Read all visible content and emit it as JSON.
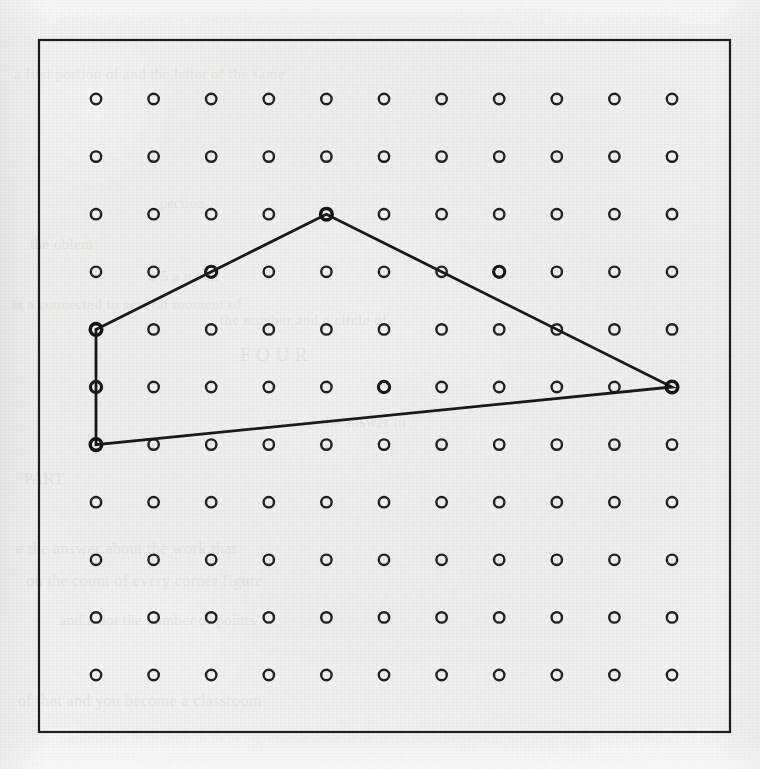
{
  "figure": {
    "kind": "geoboard-pegboard-figure",
    "background_color": "#f1f0ee",
    "ink_color": "#1a1918",
    "frame": {
      "x": 39,
      "y": 40,
      "width": 691,
      "height": 692,
      "stroke_color": "#1d1c1b",
      "stroke_width": 2.2
    }
  },
  "grid": {
    "columns": 11,
    "rows": 11,
    "origin_x": 96,
    "origin_y": 99,
    "spacing_x": 57.6,
    "spacing_y": 57.6,
    "peg_radius": 5.2,
    "peg_label": "peg",
    "peg_color": "#23211f"
  },
  "chart_data": {
    "type": "scatter",
    "title": "",
    "subtitle": "",
    "xlabel": "",
    "ylabel": "",
    "grid": true,
    "legend": "none",
    "xlim": [
      0,
      10
    ],
    "ylim": [
      0,
      10
    ],
    "xticks": [
      0,
      1,
      2,
      3,
      4,
      5,
      6,
      7,
      8,
      9,
      10
    ],
    "yticks": [
      0,
      1,
      2,
      3,
      4,
      5,
      6,
      7,
      8,
      9,
      10
    ],
    "x": [
      0,
      1,
      2,
      3,
      4,
      5,
      6,
      7,
      8,
      9,
      10
    ],
    "y": [
      0,
      1,
      2,
      3,
      4,
      5,
      6,
      7,
      8,
      9,
      10
    ],
    "series": [
      {
        "name": "pegs",
        "marker": "open-circle",
        "count": 121,
        "note": "11 columns by 11 rows of evenly spaced open circles"
      },
      {
        "name": "quadrilateral",
        "marker": "polyline-closed",
        "vertices_grid": [
          {
            "col": 0,
            "row": 4
          },
          {
            "col": 4,
            "row": 2
          },
          {
            "col": 10,
            "row": 5
          },
          {
            "col": 0,
            "row": 6
          }
        ],
        "vertices_pixel": [
          {
            "x": 96,
            "y": 329
          },
          {
            "x": 327,
            "y": 214
          },
          {
            "x": 672,
            "y": 329
          },
          {
            "x": 96,
            "y": 444
          }
        ],
        "pegs_on_edges_grid": [
          {
            "col": 2,
            "row": 3
          },
          {
            "col": 7,
            "row": 3
          },
          {
            "col": 0,
            "row": 5
          },
          {
            "col": 5,
            "row": 5
          }
        ]
      }
    ]
  },
  "polygon": {
    "name": "quadrilateral",
    "closed": true,
    "stroke_color": "#1a1918",
    "stroke_width": 2.8,
    "vertices": [
      {
        "label": "vertex-left-upper",
        "col": 0,
        "row": 4
      },
      {
        "label": "vertex-apex",
        "col": 4,
        "row": 2
      },
      {
        "label": "vertex-right",
        "col": 10,
        "row": 5
      },
      {
        "label": "vertex-left-lower",
        "col": 0,
        "row": 6
      }
    ],
    "edge_pegs": [
      {
        "label": "edge-peg-upper-left",
        "col": 2,
        "row": 3
      },
      {
        "label": "edge-peg-upper-right",
        "col": 7,
        "row": 3
      },
      {
        "label": "edge-peg-left-middle",
        "col": 0,
        "row": 5
      },
      {
        "label": "edge-peg-bottom",
        "col": 5,
        "row": 5
      }
    ]
  },
  "bleed_text": [
    {
      "text": "a first portion of and the letter of the same",
      "x": 14,
      "y": 66,
      "size": 15
    },
    {
      "text": "pection",
      "x": 160,
      "y": 196,
      "size": 14
    },
    {
      "text": "the oblem",
      "x": 30,
      "y": 236,
      "size": 15
    },
    {
      "text": "s 5 a u s th",
      "x": 150,
      "y": 268,
      "size": 15
    },
    {
      "text": "is a connected to several moment of",
      "x": 12,
      "y": 296,
      "size": 15
    },
    {
      "text": "the number and a circle of",
      "x": 220,
      "y": 312,
      "size": 15
    },
    {
      "text": "F O U R",
      "x": 240,
      "y": 344,
      "size": 19
    },
    {
      "text": "some of the answer to",
      "x": 266,
      "y": 414,
      "size": 15
    },
    {
      "text": "PART",
      "x": 24,
      "y": 470,
      "size": 16
    },
    {
      "text": "e the answer about the work that",
      "x": 16,
      "y": 540,
      "size": 16
    },
    {
      "text": "on the count of every corner figure",
      "x": 26,
      "y": 572,
      "size": 16
    },
    {
      "text": "and a dot the number of points",
      "x": 60,
      "y": 612,
      "size": 15
    },
    {
      "text": "of that and you become a classroom",
      "x": 18,
      "y": 692,
      "size": 16
    }
  ]
}
